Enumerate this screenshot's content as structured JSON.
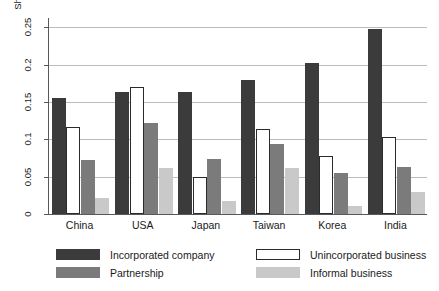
{
  "chart_data": {
    "type": "bar",
    "title": "",
    "subtitle": "",
    "xlabel": "",
    "ylabel": "Share that started a new organization",
    "categories": [
      "China",
      "USA",
      "Japan",
      "Taiwan",
      "Korea",
      "India"
    ],
    "series": [
      {
        "name": "Incorporated company",
        "color": "#3b3b3b",
        "values": [
          0.155,
          0.164,
          0.164,
          0.179,
          0.203,
          0.248
        ]
      },
      {
        "name": "Unincorporated business",
        "color": "#ffffff",
        "values": [
          0.117,
          0.17,
          0.05,
          0.114,
          0.078,
          0.103
        ]
      },
      {
        "name": "Partnership",
        "color": "#7b7b7b",
        "values": [
          0.073,
          0.122,
          0.074,
          0.094,
          0.055,
          0.063
        ]
      },
      {
        "name": "Informal business",
        "color": "#c9c9c9",
        "values": [
          0.021,
          0.062,
          0.018,
          0.062,
          0.011,
          0.03
        ]
      }
    ],
    "ylim": [
      0,
      0.26
    ],
    "yticks": [
      0,
      0.05,
      0.1,
      0.15,
      0.2,
      0.25
    ],
    "ytick_labels": [
      "0",
      "0.05",
      "0.1",
      "0.15",
      "0.2",
      "0.25"
    ],
    "grid": "horizontal",
    "legend_position": "bottom",
    "legend_order": [
      "Incorporated company",
      "Unincorporated business",
      "Partnership",
      "Informal business"
    ]
  },
  "axis": {
    "y_title": "Share that started a new organization"
  },
  "legend": {
    "items": [
      {
        "label": "Incorporated company"
      },
      {
        "label": "Unincorporated business"
      },
      {
        "label": "Partnership"
      },
      {
        "label": "Informal business"
      }
    ]
  }
}
